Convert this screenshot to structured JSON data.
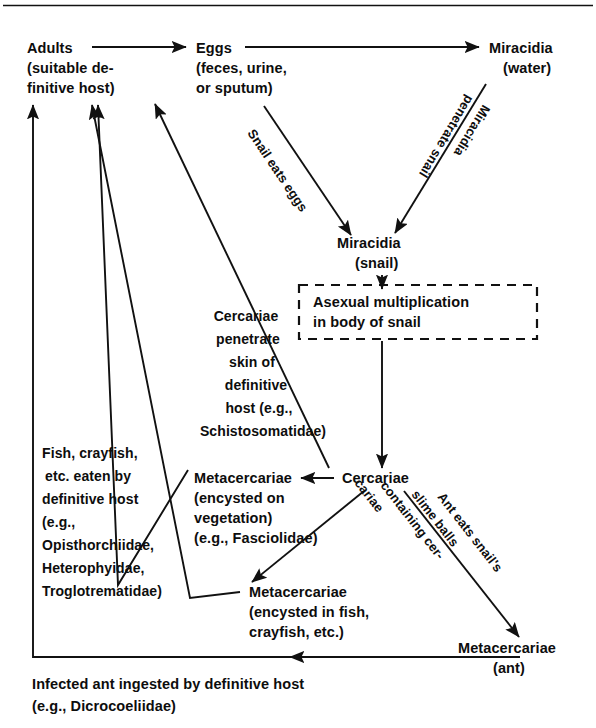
{
  "figure": {
    "type": "flow-diagram",
    "top_rule": true
  },
  "nodes": {
    "adults": {
      "lines": [
        "Adults",
        "(suitable de-",
        "finitive host)"
      ]
    },
    "eggs": {
      "lines": [
        "Eggs",
        "(feces, urine,",
        "or sputum)"
      ]
    },
    "miracidia_water": {
      "lines": [
        "Miracidia",
        "(water)"
      ]
    },
    "miracidia_snail": {
      "lines": [
        "Miracidia",
        "(snail)"
      ]
    },
    "asexual_box": {
      "lines": [
        "Asexual multiplication",
        "in body of snail"
      ]
    },
    "cercariae": {
      "lines": [
        "Cercariae"
      ]
    },
    "meta_vegetation": {
      "lines": [
        "Metacercariae",
        "(encysted on",
        "vegetation)",
        "(e.g., Fasciolidae)"
      ]
    },
    "meta_fish": {
      "lines": [
        "Metacercariae",
        "(encysted in fish,",
        "crayfish, etc.)"
      ]
    },
    "meta_ant": {
      "lines": [
        "Metacercariae",
        "(ant)"
      ]
    }
  },
  "annotations": {
    "snail_eats_eggs": {
      "lines": [
        "Snail eats eggs"
      ]
    },
    "miracidia_penetrate": {
      "lines": [
        "Miracidia",
        "penetrate snail"
      ]
    },
    "cercariae_penetrate": {
      "lines": [
        "Cercariae",
        "penetrate",
        "skin of",
        "definitive",
        "host (e.g.,",
        "Schistosomatidae)"
      ]
    },
    "fish_eaten": {
      "lines": [
        "Fish, crayfish,",
        "etc. eaten by",
        "definitive host",
        "(e.g.,",
        "Opisthorchiidae,",
        "Heterophyidae,",
        "Troglotrematidae)"
      ]
    },
    "ant_eats_slime": {
      "lines": [
        "Ant eats snail's",
        "slime balls",
        "containing cer-",
        "cariae"
      ]
    },
    "infected_ant": {
      "lines": [
        "Infected ant ingested by definitive host",
        "(e.g., Dicrocoeliidae)"
      ]
    }
  },
  "colors": {
    "ink": "#111111",
    "background": "#ffffff"
  }
}
